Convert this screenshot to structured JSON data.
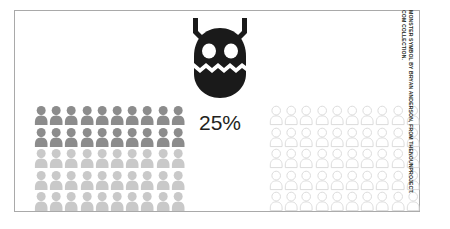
{
  "figure": {
    "percent_label": "25%",
    "icon_name": "monster-symbol",
    "background_color": "#ffffff",
    "border_color": "#a9a9a9",
    "monster_color": "#1a1a1a",
    "monster_eye_color": "#ffffff",
    "text_color": "#231f20"
  },
  "credit": {
    "line1": "MONSTER SYMBOL BY BRYAN ANDERSON, FROM THENOUNPROJECT.",
    "line2": "COM COLLECTION."
  },
  "chart_data": {
    "type": "pictogram",
    "title": "",
    "subtitle": "",
    "xlabel": "",
    "ylabel": "",
    "unit_label": "person",
    "value_label": "25%",
    "value": 25,
    "total": 100,
    "icon": "person-pictogram",
    "grids": [
      {
        "name": "left-grid",
        "columns": 10,
        "rows": 5,
        "count": 50,
        "style": "filled",
        "row_colors": [
          "#8c8c8c",
          "#8c8c8c",
          "#c9c9c9",
          "#c9c9c9",
          "#c9c9c9"
        ]
      },
      {
        "name": "right-grid",
        "columns": 10,
        "rows": 5,
        "count": 50,
        "style": "outline",
        "fill_color": "#ffffff",
        "stroke_color": "#d8d8d8"
      }
    ],
    "legend": [],
    "annotations": [
      "25%"
    ],
    "grid": false
  }
}
